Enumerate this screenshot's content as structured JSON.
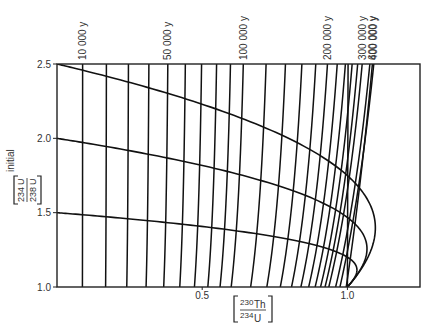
{
  "chart_data": {
    "type": "line",
    "title": "",
    "xlabel": "[230Th/234U]",
    "ylabel": "[234U/238U] initial",
    "xlim": [
      0,
      1.25
    ],
    "ylim": [
      1.0,
      2.5
    ],
    "x_ticks": [
      {
        "value": 0.5,
        "label": "0.5"
      },
      {
        "value": 1.0,
        "label": "1.0"
      }
    ],
    "y_ticks": [
      {
        "value": 1.0,
        "label": "1.0"
      },
      {
        "value": 1.5,
        "label": "1.5"
      },
      {
        "value": 2.0,
        "label": "2.0"
      },
      {
        "value": 2.5,
        "label": "2.5"
      }
    ],
    "grid": false,
    "legend": null,
    "isochron_ages_years": [
      10000,
      20000,
      30000,
      40000,
      50000,
      60000,
      70000,
      80000,
      90000,
      100000,
      120000,
      140000,
      160000,
      180000,
      200000,
      220000,
      240000,
      260000,
      280000,
      300000,
      350000,
      400000,
      600000
    ],
    "age_annotations": [
      {
        "label": "10 000 y",
        "age": 10000
      },
      {
        "label": "50 000 y",
        "age": 50000
      },
      {
        "label": "100 000 y",
        "age": 100000
      },
      {
        "label": "200 000 y",
        "age": 200000
      },
      {
        "label": "300 000 y",
        "age": 300000
      },
      {
        "label": "400 000 y",
        "age": 400000
      },
      {
        "label": "600 000 y",
        "age": 600000
      }
    ],
    "growth_curves_initial_ratio": [
      2.5,
      2.0,
      1.5
    ],
    "half_lives_years": {
      "th230": 75690,
      "u234": 245250
    },
    "series": [
      {
        "name": "initial 234U/238U = 2.5",
        "type": "growth-curve"
      },
      {
        "name": "initial 234U/238U = 2.0",
        "type": "growth-curve"
      },
      {
        "name": "initial 234U/238U = 1.5",
        "type": "growth-curve"
      },
      {
        "name": "isochrons 10 000 y – 600 000 y",
        "type": "isochron"
      }
    ]
  },
  "axes": {
    "x_label_num": "230",
    "x_label_num_el": "Th",
    "x_label_den": "234",
    "x_label_den_el": "U",
    "y_label_num": "234",
    "y_label_num_el": "U",
    "y_label_den": "238",
    "y_label_den_el": "U",
    "y_label_suffix": "initial"
  }
}
